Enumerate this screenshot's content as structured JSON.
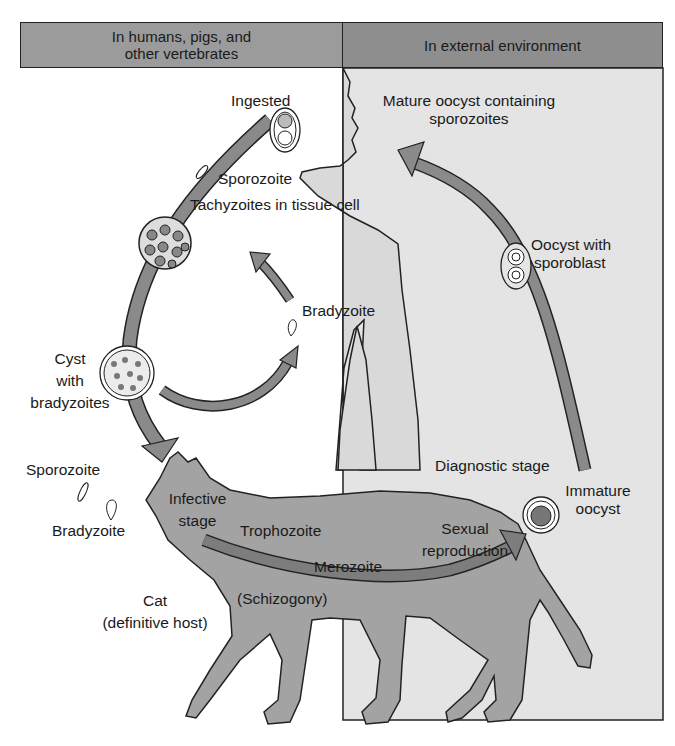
{
  "header": {
    "left": "In humans, pigs, and\nother vertebrates",
    "left_line1": "In humans, pigs, and",
    "left_line2": "other vertebrates",
    "right": "In external environment"
  },
  "labels": {
    "ingested": "Ingested",
    "mature_oocyst_1": "Mature oocyst containing",
    "mature_oocyst_2": "sporozoites",
    "sporozoite_top": "Sporozoite",
    "tachyzoites": "Tachyzoites in tissue cell",
    "oocyst_sporoblast_1": "Oocyst with",
    "oocyst_sporoblast_2": "sporoblast",
    "bradyzoite_mid": "Bradyzoite",
    "cyst_1": "Cyst",
    "cyst_2": "with",
    "cyst_3": "bradyzoites",
    "sporozoite_left": "Sporozoite",
    "bradyzoite_left": "Bradyzoite",
    "diagnostic_stage": "Diagnostic stage",
    "immature_oocyst_1": "Immature",
    "immature_oocyst_2": "oocyst",
    "infective_1": "Infective",
    "infective_2": "stage",
    "trophozoite": "Trophozoite",
    "sexual_1": "Sexual",
    "sexual_2": "reproduction",
    "merozoite": "Merozoite",
    "schizogony": "(Schizogony)",
    "cat_1": "Cat",
    "cat_2": "(definitive host)"
  },
  "colors": {
    "header_left": "#9b9b9b",
    "header_right": "#8e8e8e",
    "environment_bg": "#e4e4e4",
    "silhouette": "#d9d9d9",
    "cat": "#a3a3a3",
    "arrow": "#8a8a8a",
    "outline": "#222222"
  }
}
